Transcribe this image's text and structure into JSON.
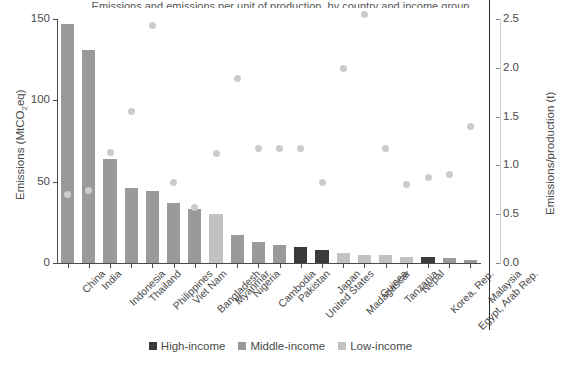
{
  "figure": {
    "clipped_title": "Emissions and emissions per unit of production, by country and income group",
    "background": "#ffffff"
  },
  "axes": {
    "left": {
      "label_text": "Emissions (MtCO",
      "label_sub": "2",
      "label_tail": "eq)",
      "label_full": "Emissions (MtCO2eq)",
      "ticks": [
        "0",
        "50",
        "100",
        "150"
      ],
      "tick_values": [
        0,
        50,
        100,
        150
      ],
      "min": 0,
      "max": 150
    },
    "right": {
      "label": "Emissions/production (t)",
      "ticks": [
        "0.0",
        "0.5",
        "1.0",
        "1.5",
        "2.0",
        "2.5"
      ],
      "tick_values": [
        0.0,
        0.5,
        1.0,
        1.5,
        2.0,
        2.5
      ],
      "min": 0,
      "max": 2.5
    }
  },
  "legend": {
    "position": "bottom-center",
    "items": [
      {
        "label": "High-income",
        "color": "#3a3a3a"
      },
      {
        "label": "Middle-income",
        "color": "#9a9a9a"
      },
      {
        "label": "Low-income",
        "color": "#c2c2c2"
      }
    ]
  },
  "colors": {
    "high_income": "#3a3a3a",
    "middle_income": "#9a9a9a",
    "low_income": "#c2c2c2",
    "dot": "#cccccc",
    "axis": "#4a4a4a",
    "right_spine": "#2b2b2b"
  },
  "chart_data": {
    "type": "bar",
    "title": "Emissions and emissions per unit of production, by country and income group",
    "xlabel": "",
    "ylabel": "Emissions (MtCO2eq)",
    "y2label": "Emissions/production (t)",
    "ylim": [
      0,
      150
    ],
    "y2lim": [
      0,
      2.5
    ],
    "grid": false,
    "legend_position": "bottom-center",
    "categories": [
      "China",
      "India",
      "Indonesia",
      "Thailand",
      "Philippines",
      "Viet Nam",
      "Bangladesh",
      "Myanmar",
      "Nigeria",
      "Cambodia",
      "Pakistan",
      "United States",
      "Japan",
      "Madagascar",
      "Guinea",
      "Tanzania",
      "Nepal",
      "Korea, Rep.",
      "Egypt, Arab Rep.",
      "Malaysia"
    ],
    "series": [
      {
        "name": "Emissions (MtCO2eq)",
        "type": "bar",
        "axis": "left",
        "values": [
          147,
          131,
          64,
          46,
          44,
          37,
          33,
          30,
          17,
          13,
          11,
          10,
          8,
          6,
          5,
          5,
          4,
          4,
          3,
          2
        ],
        "income_group": [
          "Middle-income",
          "Middle-income",
          "Middle-income",
          "Middle-income",
          "Middle-income",
          "Middle-income",
          "Middle-income",
          "Low-income",
          "Middle-income",
          "Middle-income",
          "Middle-income",
          "High-income",
          "High-income",
          "Low-income",
          "Low-income",
          "Low-income",
          "Low-income",
          "High-income",
          "Middle-income",
          "Middle-income"
        ]
      },
      {
        "name": "Emissions/production (t)",
        "type": "scatter",
        "axis": "right",
        "values": [
          0.7,
          0.74,
          1.13,
          1.55,
          2.43,
          0.82,
          0.57,
          1.12,
          1.89,
          1.17,
          1.17,
          1.17,
          0.83,
          1.99,
          2.55,
          1.17,
          0.8,
          0.88,
          0.91,
          1.4
        ]
      }
    ]
  }
}
